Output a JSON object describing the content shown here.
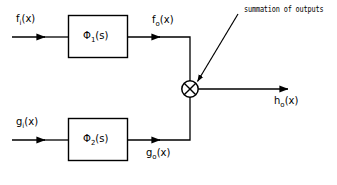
{
  "diagram": {
    "type": "block-diagram",
    "title_annotation": "summation of outputs",
    "blocks": [
      {
        "id": "block-1",
        "label_symbol": "Φ",
        "label_subscript": "1",
        "label_arg": "(s)",
        "label_full": "Φ₁(s)"
      },
      {
        "id": "block-2",
        "label_symbol": "Φ",
        "label_subscript": "2",
        "label_arg": "(s)",
        "label_full": "Φ₂(s)"
      }
    ],
    "signals": {
      "input_top_symbol": "f",
      "input_top_subscript": "i",
      "input_top_arg": "(x)",
      "input_top_full": "fᵢ(x)",
      "output_top_symbol": "f",
      "output_top_subscript": "o",
      "output_top_arg": "(x)",
      "output_top_full": "fₒ(x)",
      "input_bottom_symbol": "g",
      "input_bottom_subscript": "i",
      "input_bottom_arg": "(x)",
      "input_bottom_full": "gᵢ(x)",
      "output_bottom_symbol": "g",
      "output_bottom_subscript": "o",
      "output_bottom_arg": "(x)",
      "output_bottom_full": "gₒ(x)",
      "result_symbol": "h",
      "result_subscript": "o",
      "result_arg": "(x)",
      "result_full": "hₒ(x)"
    },
    "junction": {
      "name": "summing-junction",
      "glyph": "circle-with-cross"
    },
    "colors": {
      "stroke": "#000000",
      "background": "#ffffff",
      "text": "#000000"
    }
  }
}
